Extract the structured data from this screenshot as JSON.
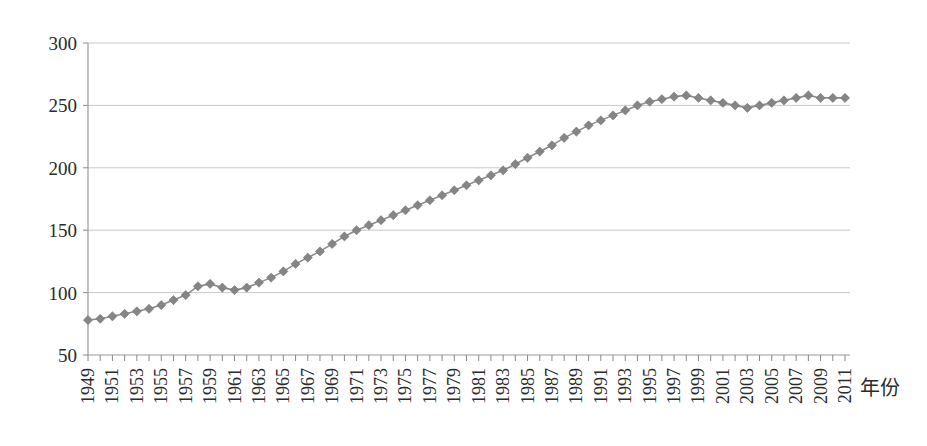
{
  "chart_data": {
    "type": "line",
    "title": "",
    "subtitle": "",
    "xlabel": "年份",
    "ylabel": "",
    "xlim": [
      1949,
      2011
    ],
    "ylim": [
      50,
      300
    ],
    "ytick_step": 50,
    "xtick_step": 1,
    "xlabel_step": 2,
    "grid": true,
    "legend": false,
    "legend_position": "none",
    "marker": "diamond",
    "series_color": "#858585",
    "grid_color": "#c9c9c9",
    "axis_color": "#9a9a9a",
    "yticks": [
      50,
      100,
      150,
      200,
      250,
      300
    ],
    "ytick_labels": [
      "50",
      "100",
      "150",
      "200",
      "250",
      "300"
    ],
    "x": [
      1949,
      1950,
      1951,
      1952,
      1953,
      1954,
      1955,
      1956,
      1957,
      1958,
      1959,
      1960,
      1961,
      1962,
      1963,
      1964,
      1965,
      1966,
      1967,
      1968,
      1969,
      1970,
      1971,
      1972,
      1973,
      1974,
      1975,
      1976,
      1977,
      1978,
      1979,
      1980,
      1981,
      1982,
      1983,
      1984,
      1985,
      1986,
      1987,
      1988,
      1989,
      1990,
      1991,
      1992,
      1993,
      1994,
      1995,
      1996,
      1997,
      1998,
      1999,
      2000,
      2001,
      2002,
      2003,
      2004,
      2005,
      2006,
      2007,
      2008,
      2009,
      2010,
      2011
    ],
    "xtick_labels": [
      "1949",
      "1950",
      "1951",
      "1952",
      "1953",
      "1954",
      "1955",
      "1956",
      "1957",
      "1958",
      "1959",
      "1960",
      "1961",
      "1962",
      "1963",
      "1964",
      "1965",
      "1966",
      "1967",
      "1968",
      "1969",
      "1970",
      "1971",
      "1972",
      "1973",
      "1974",
      "1975",
      "1976",
      "1977",
      "1978",
      "1979",
      "1980",
      "1981",
      "1982",
      "1983",
      "1984",
      "1985",
      "1986",
      "1987",
      "1988",
      "1989",
      "1990",
      "1991",
      "1992",
      "1993",
      "1994",
      "1995",
      "1996",
      "1997",
      "1998",
      "1999",
      "2000",
      "2001",
      "2002",
      "2003",
      "2004",
      "2005",
      "2006",
      "2007",
      "2008",
      "2009",
      "2010",
      "2011"
    ],
    "xtick_labels_shown": [
      "1949",
      "1951",
      "1953",
      "1955",
      "1957",
      "1959",
      "1961",
      "1963",
      "1965",
      "1967",
      "1969",
      "1971",
      "1973",
      "1975",
      "1977",
      "1979",
      "1981",
      "1983",
      "1985",
      "1987",
      "1989",
      "1991",
      "1993",
      "1995",
      "1997",
      "1999",
      "2001",
      "2003",
      "2005",
      "2007",
      "2009",
      "2011"
    ],
    "values": [
      78,
      79,
      81,
      83,
      85,
      87,
      90,
      94,
      98,
      105,
      107,
      104,
      102,
      104,
      108,
      112,
      117,
      123,
      128,
      133,
      139,
      145,
      150,
      154,
      158,
      162,
      166,
      170,
      174,
      178,
      182,
      186,
      190,
      194,
      198,
      203,
      208,
      213,
      218,
      224,
      229,
      234,
      238,
      242,
      246,
      250,
      253,
      255,
      257,
      258,
      256,
      254,
      252,
      250,
      248,
      250,
      252,
      254,
      256,
      258,
      256,
      256,
      256
    ],
    "series": [
      {
        "name": "",
        "values": [
          78,
          79,
          81,
          83,
          85,
          87,
          90,
          94,
          98,
          105,
          107,
          104,
          102,
          104,
          108,
          112,
          117,
          123,
          128,
          133,
          139,
          145,
          150,
          154,
          158,
          162,
          166,
          170,
          174,
          178,
          182,
          186,
          190,
          194,
          198,
          203,
          208,
          213,
          218,
          224,
          229,
          234,
          238,
          242,
          246,
          250,
          253,
          255,
          257,
          258,
          256,
          254,
          252,
          250,
          248,
          250,
          252,
          254,
          256,
          258,
          256,
          256,
          256
        ]
      }
    ],
    "annotations": []
  }
}
